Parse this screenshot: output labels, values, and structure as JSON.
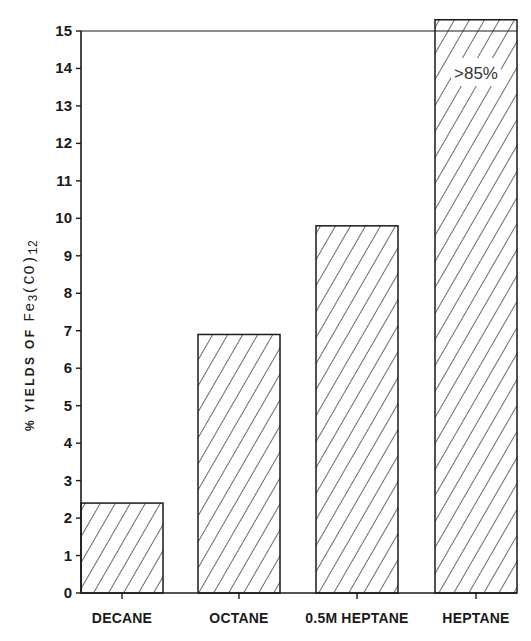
{
  "chart_data": {
    "type": "bar",
    "title": "",
    "xlabel": "",
    "ylabel": "% YIELDS OF Fe3(CO)12",
    "ylabel_parts": {
      "prefix": "% YIELDS OF ",
      "formula_main": "Fe",
      "sub1": "3",
      "formula_mid": "(CO)",
      "sub2": "12"
    },
    "categories": [
      "DECANE",
      "OCTANE",
      "0.5M HEPTANE",
      "HEPTANE"
    ],
    "values": [
      2.4,
      6.9,
      9.8,
      85
    ],
    "display_values": [
      2.4,
      6.9,
      9.8,
      15.3
    ],
    "ylim": [
      0,
      15
    ],
    "yticks": [
      0,
      1,
      2,
      3,
      4,
      5,
      6,
      7,
      8,
      9,
      10,
      11,
      12,
      13,
      14,
      15
    ],
    "annotations": [
      {
        "category": "HEPTANE",
        "text": ">85%",
        "note": "bar truncated above axis; actual value exceeds 85%"
      }
    ],
    "fill": "diagonal hatch",
    "grid": false,
    "legend": null
  },
  "colors": {
    "ink": "#1a1a1a",
    "background": "#ffffff"
  }
}
